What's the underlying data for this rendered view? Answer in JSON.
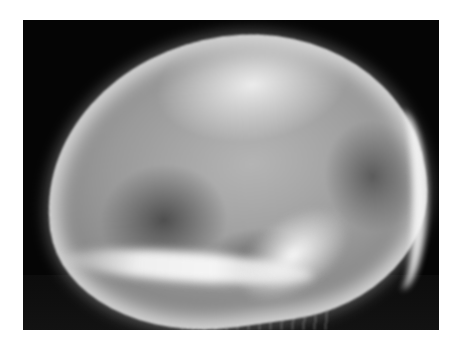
{
  "image": {
    "subject": "lateral skull radiograph",
    "description": "Grayscale X-ray of a human skull in lateral view on a black background with white margin",
    "colors": {
      "page_background": "#ffffff",
      "film_background": "#050505",
      "bone_highlight": "#f0f0f0",
      "bone_mid": "#9a9a9a"
    }
  }
}
